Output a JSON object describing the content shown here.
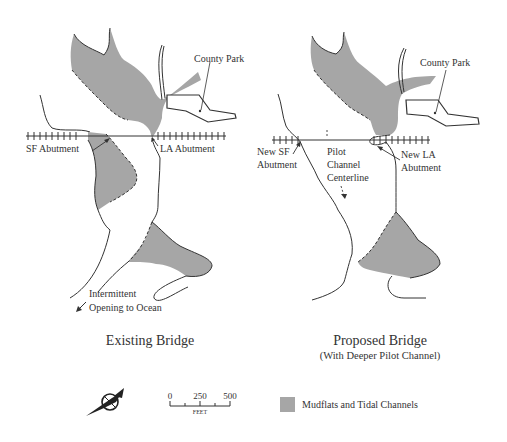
{
  "colors": {
    "mudflat_fill": "#a6a6a6",
    "line": "#333333",
    "background": "#ffffff"
  },
  "panels": [
    {
      "id": "existing",
      "title": "Existing Bridge",
      "subtitle": "",
      "labels": {
        "county_park": "County Park",
        "sf_abutment": "SF Abutment",
        "la_abutment": "LA Abutment",
        "opening_line1": "Intermittent",
        "opening_line2": "Opening to Ocean"
      }
    },
    {
      "id": "proposed",
      "title": "Proposed Bridge",
      "subtitle": "(With Deeper Pilot Channel)",
      "labels": {
        "county_park": "County Park",
        "new_sf_line1": "New SF",
        "new_sf_line2": "Abutment",
        "pilot_line1": "Pilot",
        "pilot_line2": "Channel",
        "pilot_line3": "Centerline",
        "new_la_line1": "New LA",
        "new_la_line2": "Abutment"
      }
    }
  ],
  "legend": {
    "north_arrow_icon": "compass-north-arrow",
    "scale": {
      "ticks": [
        "0",
        "250",
        "500"
      ],
      "unit": "FEET"
    },
    "mudflats_label": "Mudflats and Tidal Channels"
  }
}
